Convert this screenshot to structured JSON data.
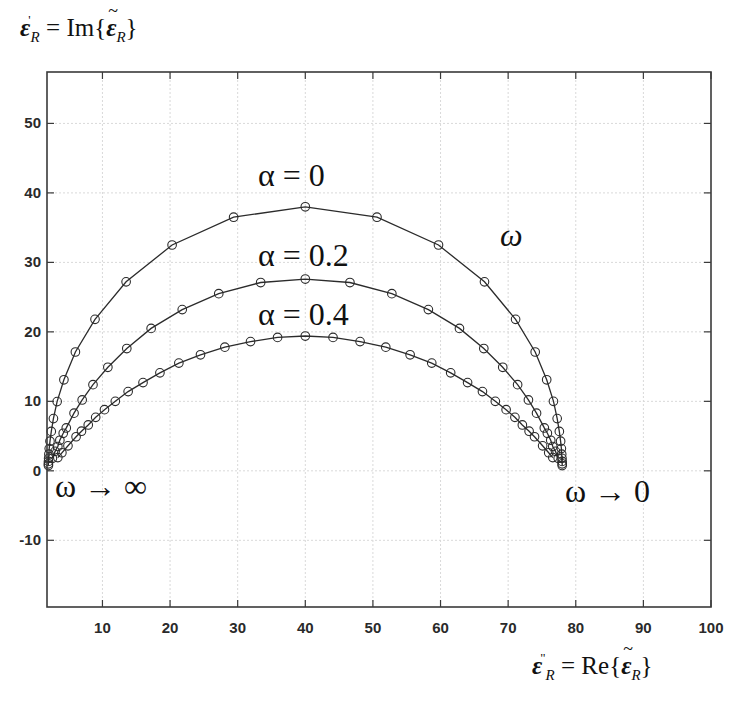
{
  "y_axis_title": {
    "lhs_symbol": "ε",
    "lhs_sub": "R",
    "lhs_prime": "'",
    "rhs_func": "Im",
    "rhs_symbol": "ε",
    "rhs_sub": "R"
  },
  "x_axis_title": {
    "lhs_symbol": "ε",
    "lhs_sub": "R",
    "lhs_prime": "\"",
    "rhs_func": "Re",
    "rhs_symbol": "ε",
    "rhs_sub": "R"
  },
  "annotations": {
    "alpha_0": "α = 0",
    "alpha_02": "α = 0.2",
    "alpha_04": "α = 0.4",
    "omega": "ω",
    "omega_inf": "ω → ∞",
    "omega_zero": "ω → 0"
  },
  "colors": {
    "line": "#2b2b2b",
    "marker": "#2b2b2b",
    "grid": "#d9d9d9",
    "axis": "#3a3a3a"
  },
  "chart_data": {
    "type": "line",
    "title": "",
    "xlabel": "ε''_R = Re{ε̃_R}",
    "ylabel": "ε'_R = Im{ε̃_R}",
    "xlim": [
      1.8,
      100
    ],
    "ylim": [
      -19.6,
      57.4
    ],
    "grid": true,
    "x_ticks": [
      10,
      20,
      30,
      40,
      50,
      60,
      70,
      80,
      90,
      100
    ],
    "y_ticks": [
      -10,
      0,
      10,
      20,
      30,
      40,
      50
    ],
    "marker": "open-circle",
    "series": [
      {
        "name": "α = 0",
        "x": [
          2.01,
          2.01,
          2.02,
          2.04,
          2.08,
          2.13,
          2.24,
          2.43,
          2.75,
          3.3,
          4.3,
          6.0,
          8.9,
          13.5,
          20.3,
          29.4,
          40.0,
          50.6,
          59.7,
          66.5,
          71.1,
          74.0,
          75.7,
          76.7,
          77.25,
          77.57,
          77.76,
          77.87,
          77.92,
          77.96,
          77.98,
          77.99,
          77.99
        ],
        "y": [
          0.76,
          1.01,
          1.35,
          1.8,
          2.4,
          3.2,
          4.26,
          5.67,
          7.52,
          9.96,
          13.1,
          17.1,
          21.8,
          27.2,
          32.5,
          36.5,
          38.0,
          36.5,
          32.5,
          27.2,
          21.8,
          17.1,
          13.1,
          10.0,
          7.52,
          5.67,
          4.26,
          3.2,
          2.4,
          1.8,
          1.35,
          1.01,
          0.76
        ]
      },
      {
        "name": "α = 0.2",
        "x": [
          2.6,
          3.0,
          3.4,
          3.7,
          4.2,
          4.65,
          5.8,
          7.0,
          8.6,
          10.8,
          13.6,
          17.2,
          21.8,
          27.2,
          33.4,
          40.0,
          46.6,
          52.8,
          58.2,
          62.8,
          66.4,
          69.2,
          71.4,
          73.0,
          74.2,
          75.35,
          75.8,
          76.3,
          76.6,
          77.0,
          77.4
        ],
        "y": [
          1.8,
          2.8,
          3.5,
          4.4,
          5.4,
          6.17,
          8.3,
          10.2,
          12.4,
          14.9,
          17.6,
          20.5,
          23.2,
          25.5,
          27.1,
          27.6,
          27.1,
          25.5,
          23.2,
          20.5,
          17.6,
          14.9,
          12.4,
          10.2,
          8.3,
          6.17,
          5.4,
          4.4,
          3.5,
          2.8,
          1.8
        ]
      },
      {
        "name": "α = 0.4",
        "x": [
          3.4,
          4.0,
          4.9,
          6.1,
          6.9,
          7.9,
          9.0,
          10.3,
          11.9,
          13.8,
          16.0,
          18.5,
          21.3,
          24.5,
          28.1,
          31.9,
          35.9,
          40.0,
          44.1,
          48.1,
          51.9,
          55.5,
          58.7,
          61.5,
          64.0,
          66.2,
          68.1,
          69.7,
          71.0,
          72.1,
          73.1,
          73.9,
          75.1,
          76.0,
          76.6
        ],
        "y": [
          1.9,
          2.6,
          3.6,
          4.9,
          5.7,
          6.6,
          7.7,
          8.8,
          10.0,
          11.4,
          12.7,
          14.1,
          15.5,
          16.7,
          17.8,
          18.6,
          19.2,
          19.4,
          19.2,
          18.6,
          17.8,
          16.7,
          15.5,
          14.1,
          12.7,
          11.4,
          10.0,
          8.8,
          7.7,
          6.6,
          5.7,
          4.9,
          3.6,
          2.6,
          1.9
        ]
      }
    ],
    "annotations": [
      {
        "text": "α = 0",
        "x": 40,
        "y": 42
      },
      {
        "text": "α = 0.2",
        "x": 40,
        "y": 30.5
      },
      {
        "text": "α = 0.4",
        "x": 40,
        "y": 22
      },
      {
        "text": "ω",
        "x": 72.5,
        "y": 34
      },
      {
        "text": "ω → ∞",
        "x": 8,
        "y": -1.5
      },
      {
        "text": "ω → 0",
        "x": 86,
        "y": -1.5
      }
    ]
  }
}
